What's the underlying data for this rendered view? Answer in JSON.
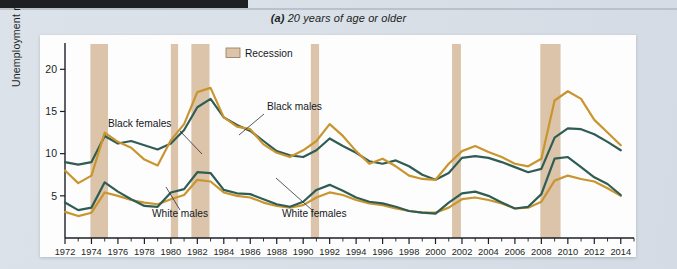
{
  "figure": {
    "panel_label": "(a)",
    "title": "20 years of age or older",
    "legend_label": "Recession"
  },
  "annotations": {
    "black_females": "Black females",
    "black_males": "Black males",
    "white_males": "White males",
    "white_females": "White females"
  },
  "colors": {
    "black_males_line": "#c9952f",
    "black_females_line": "#2f5d54",
    "white_males_line": "#c9952f",
    "white_females_line": "#2f5d54",
    "recession_band": "#dcc4ab",
    "panel_background": "#fdfdfd",
    "page_background": "#dce2e9",
    "axis": "#1b1f24"
  },
  "chart_data": {
    "type": "line",
    "title": "(a) 20 years of age or older",
    "xlabel": "",
    "ylabel": "Unemployment rate (percent)",
    "xlim": [
      1972,
      2015
    ],
    "ylim": [
      0,
      23
    ],
    "yticks": [
      5,
      10,
      15,
      20
    ],
    "ytick_labels": [
      "5",
      "10",
      "15",
      "20"
    ],
    "xticks": [
      1972,
      1974,
      1976,
      1978,
      1980,
      1982,
      1984,
      1986,
      1988,
      1990,
      1992,
      1994,
      1996,
      1998,
      2000,
      2002,
      2004,
      2006,
      2008,
      2010,
      2012,
      2014
    ],
    "xtick_labels": [
      "1972",
      "1974",
      "1976",
      "1978",
      "1980",
      "1982",
      "1984",
      "1986",
      "1988",
      "1990",
      "1992",
      "1994",
      "1996",
      "1998",
      "2000",
      "2002",
      "2004",
      "2006",
      "2008",
      "2010",
      "2012",
      "2014"
    ],
    "minor_xticks_every": 1,
    "grid": false,
    "legend": {
      "position": "top-center-inside",
      "entries": [
        "Recession"
      ]
    },
    "x": [
      1972,
      1973,
      1974,
      1975,
      1976,
      1977,
      1978,
      1979,
      1980,
      1981,
      1982,
      1983,
      1984,
      1985,
      1986,
      1987,
      1988,
      1989,
      1990,
      1991,
      1992,
      1993,
      1994,
      1995,
      1996,
      1997,
      1998,
      1999,
      2000,
      2001,
      2002,
      2003,
      2004,
      2005,
      2006,
      2007,
      2008,
      2009,
      2010,
      2011,
      2012,
      2013,
      2014
    ],
    "series": [
      {
        "name": "Black males",
        "color": "#c9952f",
        "values": [
          8.0,
          6.5,
          7.4,
          12.5,
          11.4,
          10.7,
          9.3,
          8.6,
          11.6,
          13.5,
          17.3,
          17.8,
          14.3,
          13.2,
          12.9,
          11.1,
          10.1,
          9.6,
          10.4,
          11.5,
          13.5,
          12.1,
          10.3,
          8.8,
          9.4,
          8.5,
          7.4,
          7.0,
          6.9,
          8.8,
          10.3,
          10.9,
          10.2,
          9.6,
          8.8,
          8.5,
          9.4,
          16.3,
          17.4,
          16.5,
          14.0,
          12.5,
          11.0
        ],
        "units": "percent"
      },
      {
        "name": "Black females",
        "color": "#2f5d54",
        "values": [
          9.0,
          8.7,
          9.0,
          12.1,
          11.2,
          11.5,
          11.0,
          10.5,
          11.2,
          12.8,
          15.5,
          16.5,
          14.3,
          13.4,
          12.7,
          11.5,
          10.3,
          9.8,
          9.6,
          10.4,
          11.8,
          10.9,
          10.1,
          9.1,
          8.8,
          9.2,
          8.5,
          7.5,
          6.9,
          7.7,
          9.5,
          9.7,
          9.5,
          9.0,
          8.4,
          7.8,
          8.2,
          11.9,
          13.0,
          12.9,
          12.3,
          11.4,
          10.4
        ],
        "units": "percent"
      },
      {
        "name": "White males",
        "color": "#2f5d54",
        "values": [
          4.2,
          3.3,
          3.6,
          6.6,
          5.5,
          4.6,
          3.8,
          3.7,
          5.4,
          5.8,
          7.8,
          7.7,
          5.7,
          5.3,
          5.2,
          4.6,
          4.0,
          3.7,
          4.3,
          5.7,
          6.3,
          5.6,
          4.8,
          4.3,
          4.1,
          3.7,
          3.2,
          3.0,
          2.9,
          4.2,
          5.3,
          5.5,
          5.0,
          4.2,
          3.5,
          3.7,
          5.2,
          9.4,
          9.6,
          8.4,
          7.2,
          6.4,
          5.1
        ],
        "units": "percent"
      },
      {
        "name": "White females",
        "color": "#c9952f",
        "values": [
          3.1,
          2.6,
          3.0,
          5.4,
          5.0,
          4.5,
          4.2,
          4.0,
          4.6,
          5.1,
          6.9,
          6.7,
          5.4,
          5.0,
          4.8,
          4.2,
          3.8,
          3.6,
          3.9,
          4.8,
          5.4,
          5.1,
          4.5,
          4.1,
          3.9,
          3.5,
          3.2,
          3.0,
          3.0,
          3.6,
          4.6,
          4.8,
          4.5,
          4.1,
          3.5,
          3.6,
          4.3,
          6.8,
          7.4,
          7.0,
          6.7,
          5.9,
          5.0
        ],
        "units": "percent"
      }
    ],
    "recessions": [
      {
        "start": 1973.92,
        "end": 1975.25
      },
      {
        "start": 1980.0,
        "end": 1980.55
      },
      {
        "start": 1981.55,
        "end": 1982.92
      },
      {
        "start": 1990.58,
        "end": 1991.2
      },
      {
        "start": 2001.25,
        "end": 2001.92
      },
      {
        "start": 2007.92,
        "end": 2009.45
      }
    ]
  }
}
